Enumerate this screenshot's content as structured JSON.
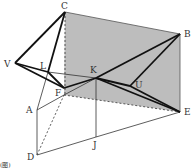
{
  "diagram": {
    "type": "3d-geometry",
    "colors": {
      "shaded_plane": "#bdbdbd",
      "line": "#111111",
      "thin_line": "#333333"
    },
    "points": {
      "C": {
        "label": "C",
        "x": 65,
        "y": 12
      },
      "B": {
        "label": "B",
        "x": 180,
        "y": 34
      },
      "V": {
        "label": "V",
        "x": 15,
        "y": 63
      },
      "L": {
        "label": "L",
        "x": 48,
        "y": 72
      },
      "F": {
        "label": "F",
        "x": 64,
        "y": 88
      },
      "K": {
        "label": "K",
        "x": 96,
        "y": 78
      },
      "U": {
        "label": "U",
        "x": 130,
        "y": 86
      },
      "E": {
        "label": "E",
        "x": 180,
        "y": 112
      },
      "A": {
        "label": "A",
        "x": 37,
        "y": 110
      },
      "D": {
        "label": "D",
        "x": 37,
        "y": 155
      },
      "J": {
        "label": "J",
        "x": 96,
        "y": 137
      }
    },
    "shaded_plane": [
      "C",
      "B",
      "E",
      "F"
    ],
    "corner_mark": "(图)"
  }
}
